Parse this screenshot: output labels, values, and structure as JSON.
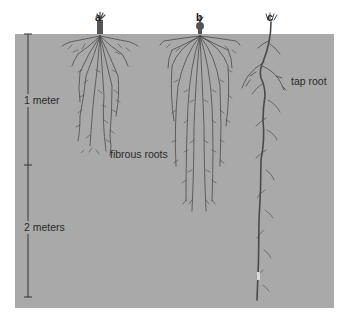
{
  "diagram": {
    "colors": {
      "soil": "#a9a9a9",
      "root": "#4a4a4a",
      "background": "#ffffff",
      "text": "#2b2b2b"
    },
    "plants": [
      {
        "letter": "a",
        "type": "fibrous",
        "depth_m": 1.0
      },
      {
        "letter": "b",
        "type": "fibrous",
        "depth_m": 1.4
      },
      {
        "letter": "c",
        "type": "tap",
        "depth_m": 2.0
      }
    ],
    "labels": {
      "fibrous": "fibrous roots",
      "tap": "tap root"
    },
    "scale": {
      "ticks": [
        "0",
        "1 meter",
        "2 meters"
      ],
      "one_meter": "1 meter",
      "two_meters": "2 meters"
    }
  }
}
